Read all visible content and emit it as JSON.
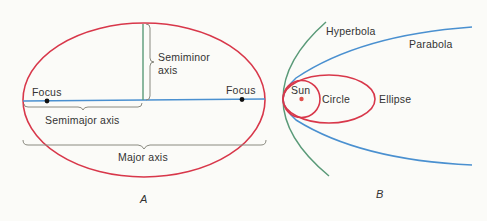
{
  "panel_a": {
    "caption": "A",
    "labels": {
      "focus_left": "Focus",
      "focus_right": "Focus",
      "semiminor_line1": "Semiminor",
      "semiminor_line2": "axis",
      "semimajor": "Semimajor axis",
      "major": "Major axis"
    }
  },
  "panel_b": {
    "caption": "B",
    "labels": {
      "hyperbola": "Hyperbola",
      "parabola": "Parabola",
      "sun": "Sun",
      "circle": "Circle",
      "ellipse": "Ellipse"
    }
  },
  "colors": {
    "ellipse_red": "#d8374a",
    "axis_blue": "#4a90d0",
    "hyperbola_green": "#5a9a78",
    "brace_gray": "#8a8a80",
    "text": "#333333"
  }
}
